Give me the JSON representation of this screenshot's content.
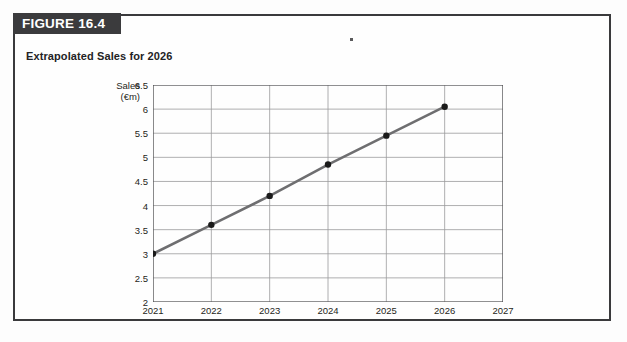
{
  "figure": {
    "banner_label": "FIGURE 16.4",
    "subtitle": "Extrapolated Sales for 2026"
  },
  "colors": {
    "banner_background": "#3b3b3d",
    "banner_text": "#ffffff",
    "outer_border": "#3a3a3c",
    "series_line": "#6e6e70",
    "marker": "#1a1a1a",
    "grid": "#9a9a9c",
    "axis": "#4a4a4c",
    "page_background": "#fdfdfd"
  },
  "chart_data": {
    "type": "line",
    "title": "Extrapolated Sales for 2026",
    "xlabel": "",
    "ylabel": "Sales (€m)",
    "ylabel_lines": [
      "Sales",
      "(€m)"
    ],
    "x": [
      2021,
      2022,
      2023,
      2024,
      2025,
      2026
    ],
    "values": [
      3,
      3.6,
      4.2,
      4.85,
      5.45,
      6.05
    ],
    "series": [
      {
        "name": "Sales (€m)",
        "values": [
          3,
          3.6,
          4.2,
          4.85,
          5.45,
          6.05
        ]
      }
    ],
    "xlim": [
      2021,
      2027
    ],
    "ylim": [
      2,
      6.5
    ],
    "xticks": [
      2021,
      2022,
      2023,
      2024,
      2025,
      2026,
      2027
    ],
    "xtick_labels": [
      "2021",
      "2022",
      "2023",
      "2024",
      "2025",
      "2026",
      "2027"
    ],
    "yticks": [
      2,
      2.5,
      3,
      3.5,
      4,
      4.5,
      5,
      5.5,
      6,
      6.5
    ],
    "ytick_labels": [
      "2",
      "2.5",
      "3",
      "3.5",
      "4",
      "4.5",
      "5",
      "5.5",
      "6",
      "6.5"
    ],
    "grid": true,
    "legend": false,
    "markers": true
  }
}
